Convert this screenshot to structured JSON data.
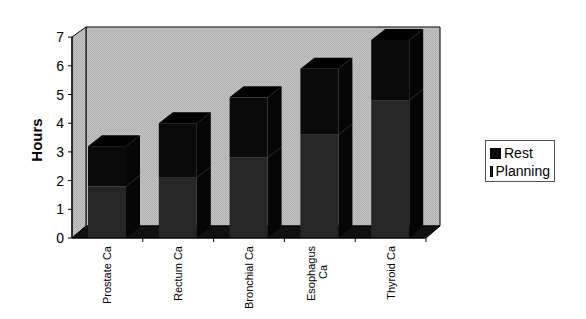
{
  "chart_data": {
    "type": "bar",
    "stacked": true,
    "three_d": true,
    "title": "",
    "xlabel": "",
    "ylabel": "Hours",
    "ylim": [
      0,
      7
    ],
    "yticks": [
      0,
      1,
      2,
      3,
      4,
      5,
      6,
      7
    ],
    "categories": [
      "Prostate Ca",
      "Rectum Ca",
      "Bronchial Ca",
      "Esophagus Ca",
      "Thyroid Ca"
    ],
    "series": [
      {
        "name": "Planning",
        "values": [
          1.8,
          2.1,
          2.8,
          3.6,
          4.8
        ],
        "color": "#262626"
      },
      {
        "name": "Rest",
        "values": [
          1.4,
          1.9,
          2.1,
          2.3,
          2.1
        ],
        "color": "#0a0a0a"
      }
    ],
    "totals": [
      3.2,
      4.0,
      4.9,
      5.9,
      6.9
    ],
    "legend_position": "right",
    "grid": false
  },
  "legend": {
    "items": [
      {
        "label": "Rest",
        "color": "#0a0a0a"
      },
      {
        "label": "Planning",
        "color": "#262626"
      }
    ]
  }
}
